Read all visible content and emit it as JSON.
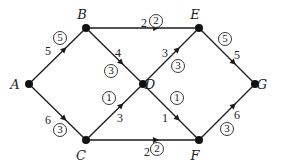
{
  "diagram": {
    "type": "directed-network-flow",
    "colors": {
      "stroke": "#1a1a1a",
      "node": "#111111",
      "background": "#ffffff"
    },
    "nodes": [
      {
        "id": "A",
        "label": "A",
        "x": 29,
        "y": 84,
        "lx": 15,
        "ly": 89
      },
      {
        "id": "B",
        "label": "B",
        "x": 86,
        "y": 28,
        "lx": 82,
        "ly": 19
      },
      {
        "id": "C",
        "label": "C",
        "x": 86,
        "y": 140,
        "lx": 81,
        "ly": 160
      },
      {
        "id": "D",
        "label": "D",
        "x": 143,
        "y": 84,
        "lx": 150,
        "ly": 89
      },
      {
        "id": "E",
        "label": "E",
        "x": 199,
        "y": 28,
        "lx": 195,
        "ly": 19
      },
      {
        "id": "F",
        "label": "F",
        "x": 199,
        "y": 140,
        "lx": 195,
        "ly": 160
      },
      {
        "id": "G",
        "label": "G",
        "x": 255,
        "y": 84,
        "lx": 262,
        "ly": 89
      }
    ],
    "edges": [
      {
        "from": "A",
        "to": "B",
        "capacity": "5",
        "flow": "5",
        "cx": 48,
        "cy": 52,
        "fx": 60,
        "fy": 38
      },
      {
        "from": "A",
        "to": "C",
        "capacity": "6",
        "flow": "3",
        "cx": 48,
        "cy": 121,
        "fx": 60,
        "fy": 130
      },
      {
        "from": "B",
        "to": "E",
        "capacity": "2",
        "flow": "2",
        "cx": 144,
        "cy": 24,
        "fx": 156,
        "fy": 21
      },
      {
        "from": "B",
        "to": "D",
        "capacity": "4",
        "flow": "3",
        "cx": 118,
        "cy": 54,
        "fx": 111,
        "fy": 71
      },
      {
        "from": "C",
        "to": "D",
        "capacity": "3",
        "flow": "1",
        "cx": 120,
        "cy": 119,
        "fx": 109,
        "fy": 98
      },
      {
        "from": "C",
        "to": "F",
        "capacity": "2",
        "flow": "2",
        "cx": 147,
        "cy": 153,
        "fx": 157,
        "fy": 149
      },
      {
        "from": "D",
        "to": "E",
        "capacity": "3",
        "flow": "3",
        "cx": 165,
        "cy": 54,
        "fx": 178,
        "fy": 66
      },
      {
        "from": "D",
        "to": "F",
        "capacity": "1",
        "flow": "1",
        "cx": 165,
        "cy": 119,
        "fx": 177,
        "fy": 98
      },
      {
        "from": "E",
        "to": "G",
        "capacity": "5",
        "flow": "5",
        "cx": 237,
        "cy": 56,
        "fx": 225,
        "fy": 39
      },
      {
        "from": "F",
        "to": "G",
        "capacity": "6",
        "flow": "3",
        "cx": 237,
        "cy": 116,
        "fx": 227,
        "fy": 129
      }
    ]
  }
}
